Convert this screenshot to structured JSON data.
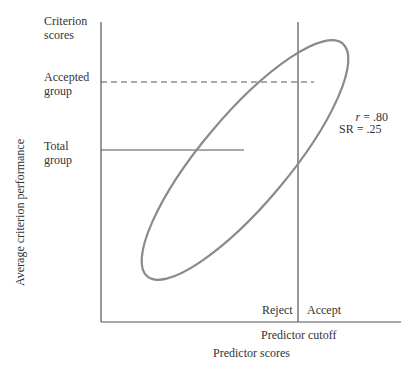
{
  "labels": {
    "criterion_scores": [
      "Criterion",
      "scores"
    ],
    "accepted_group": [
      "Accepted",
      "group"
    ],
    "total_group": [
      "Total",
      "group"
    ],
    "y_axis": "Average criterion performance",
    "x_axis": "Predictor scores",
    "cutoff": "Predictor cutoff",
    "reject": "Reject",
    "accept": "Accept",
    "r_label": "r",
    "r_value": " = .80",
    "sr": "SR = .25"
  },
  "colors": {
    "axis": "#555555",
    "ellipse": "#8a8a8a",
    "text": "#333333"
  }
}
